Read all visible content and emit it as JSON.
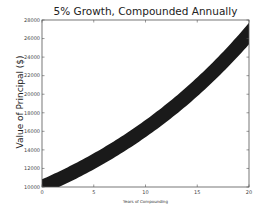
{
  "chart_data": {
    "type": "line",
    "title": "5% Growth, Compounded Annually",
    "xlabel": "Years of Compounding",
    "ylabel": "Value of Principal ($)",
    "xlim": [
      0,
      20
    ],
    "ylim": [
      10000,
      28000
    ],
    "xticks": [
      0,
      5,
      10,
      15,
      20
    ],
    "yticks": [
      10000,
      12000,
      14000,
      16000,
      18000,
      20000,
      22000,
      24000,
      26000,
      28000
    ],
    "grid": false,
    "legend": null,
    "line_color": "#1a1a1a",
    "line_style": "very thick band",
    "series": [
      {
        "name": "Principal",
        "x": [
          0,
          2,
          4,
          6,
          8,
          10,
          12,
          14,
          16,
          18,
          20
        ],
        "values": [
          10000,
          11025,
          12155,
          13401,
          14775,
          16289,
          17959,
          19799,
          21829,
          24066,
          26533
        ]
      }
    ]
  }
}
